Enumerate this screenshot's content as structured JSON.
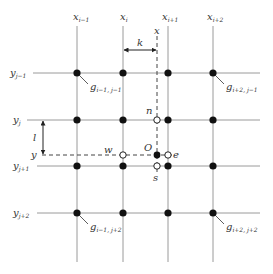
{
  "diagram": {
    "columns": [
      {
        "base": "x",
        "sub": "i−1"
      },
      {
        "base": "x",
        "sub": "i"
      },
      {
        "base": "x",
        "sub": "i+1"
      },
      {
        "base": "x",
        "sub": "i+2"
      }
    ],
    "rows": [
      {
        "base": "y",
        "sub": "j−1"
      },
      {
        "base": "y",
        "sub": "j"
      },
      {
        "base": "y",
        "sub": "j+1"
      },
      {
        "base": "y",
        "sub": "j+2"
      }
    ],
    "query_x_label": "x",
    "query_y_label": "y",
    "spacing_x_label": "k",
    "spacing_y_label": "l",
    "origin_label": "O",
    "neighbors": {
      "north": "n",
      "south": "s",
      "east": "e",
      "west": "w"
    },
    "corner_labels": [
      {
        "base": "g",
        "sub": "i−1, j−1"
      },
      {
        "base": "g",
        "sub": "i+2, j−1"
      },
      {
        "base": "g",
        "sub": "i−1, j+2"
      },
      {
        "base": "g",
        "sub": "i+2, j+2"
      }
    ],
    "colors": {
      "grid": "#999999",
      "node": "#111111",
      "text": "#333333"
    }
  }
}
